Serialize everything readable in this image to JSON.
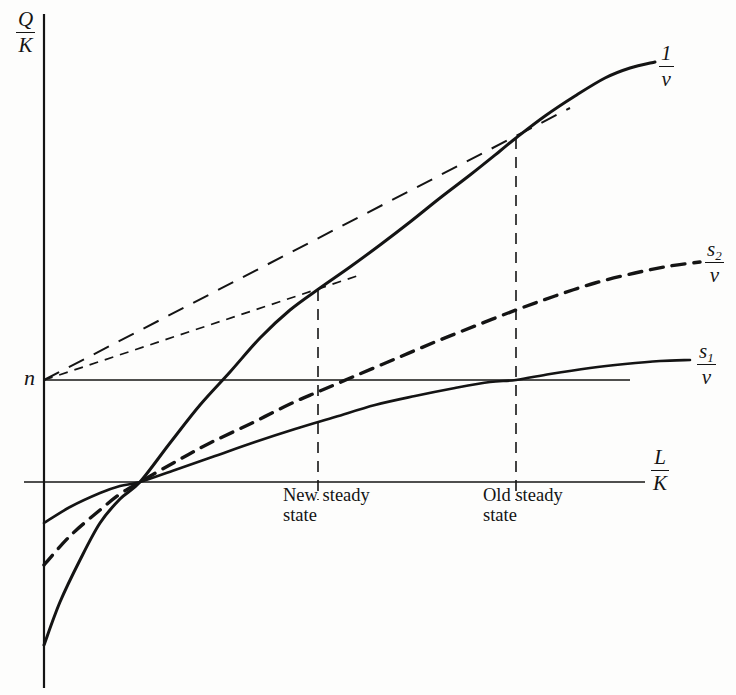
{
  "figure": {
    "background_color": "#fdfdfc",
    "ink_color": "#141414"
  },
  "axes": {
    "y_axis": {
      "label_numerator": "Q",
      "label_denominator": "K",
      "name": "output-capital-ratio"
    },
    "x_axis": {
      "label_numerator": "L",
      "label_denominator": "K",
      "name": "labor-capital-ratio"
    },
    "reference_line": {
      "label": "n",
      "description": "natural rate of growth line"
    }
  },
  "curves": [
    {
      "id": "one-over-v",
      "label_numerator": "1",
      "label_denominator": "v",
      "style": "solid",
      "width": 3.0
    },
    {
      "id": "s2-over-v",
      "label_numerator": "s",
      "label_subscript": "2",
      "label_denominator": "v",
      "style": "dashed",
      "width": 3.4
    },
    {
      "id": "s1-over-v",
      "label_numerator": "s",
      "label_subscript": "1",
      "label_denominator": "v",
      "style": "solid",
      "width": 2.6
    }
  ],
  "annotations": {
    "new_steady_state": {
      "line1": "New steady",
      "line2": "state"
    },
    "old_steady_state": {
      "line1": "Old steady",
      "line2": "state"
    }
  },
  "chart_data": {
    "type": "line",
    "title": "",
    "xlabel": "L/K",
    "ylabel": "Q/K",
    "grid": false,
    "legend": "inline-right-of-curve-ends",
    "axis_origin_px": [
      44,
      482
    ],
    "n_level_px_y": 380,
    "common_crossing_px": [
      140,
      482
    ],
    "series": [
      {
        "name": "1/v",
        "style": "solid",
        "points_px": [
          [
            44,
            645
          ],
          [
            60,
            602
          ],
          [
            80,
            560
          ],
          [
            100,
            523
          ],
          [
            120,
            499
          ],
          [
            140,
            482
          ],
          [
            170,
            443
          ],
          [
            200,
            405
          ],
          [
            230,
            372
          ],
          [
            260,
            338
          ],
          [
            290,
            310
          ],
          [
            320,
            288
          ],
          [
            350,
            267
          ],
          [
            380,
            245
          ],
          [
            410,
            222
          ],
          [
            440,
            198
          ],
          [
            470,
            175
          ],
          [
            500,
            151
          ],
          [
            516,
            138
          ],
          [
            545,
            116
          ],
          [
            575,
            96
          ],
          [
            605,
            78
          ],
          [
            630,
            68
          ],
          [
            655,
            62
          ]
        ]
      },
      {
        "name": "s2/v",
        "style": "dashed",
        "points_px": [
          [
            44,
            565
          ],
          [
            70,
            536
          ],
          [
            100,
            510
          ],
          [
            120,
            494
          ],
          [
            140,
            482
          ],
          [
            175,
            462
          ],
          [
            210,
            443
          ],
          [
            250,
            424
          ],
          [
            290,
            404
          ],
          [
            320,
            391
          ],
          [
            355,
            376
          ],
          [
            395,
            359
          ],
          [
            435,
            342
          ],
          [
            475,
            326
          ],
          [
            516,
            310
          ],
          [
            555,
            296
          ],
          [
            595,
            283
          ],
          [
            635,
            273
          ],
          [
            670,
            266
          ],
          [
            700,
            262
          ]
        ]
      },
      {
        "name": "s1/v",
        "style": "solid",
        "points_px": [
          [
            44,
            523
          ],
          [
            70,
            507
          ],
          [
            100,
            493
          ],
          [
            120,
            486
          ],
          [
            140,
            482
          ],
          [
            175,
            470
          ],
          [
            215,
            456
          ],
          [
            255,
            442
          ],
          [
            295,
            429
          ],
          [
            335,
            417
          ],
          [
            375,
            405
          ],
          [
            415,
            396
          ],
          [
            455,
            388
          ],
          [
            490,
            382
          ],
          [
            516,
            380
          ],
          [
            550,
            374
          ],
          [
            590,
            368
          ],
          [
            625,
            364
          ],
          [
            660,
            361
          ],
          [
            690,
            360
          ]
        ]
      }
    ],
    "tangent_rays": [
      {
        "name": "tangent-to-old-steady-state",
        "from_px": [
          44,
          380
        ],
        "to_px": [
          570,
          108
        ],
        "style": "long-dash",
        "touches_curve": "1/v",
        "tangency_px": [
          516,
          138
        ]
      },
      {
        "name": "tangent-to-new-steady-state",
        "from_px": [
          44,
          380
        ],
        "to_px": [
          360,
          275
        ],
        "style": "short-dash",
        "touches_curve": "1/v",
        "tangency_px": [
          318,
          290
        ]
      }
    ],
    "drop_lines": [
      {
        "name": "new-steady-state-dropline",
        "x_px": 318,
        "y_top_px": 290,
        "y_bottom_px": 500
      },
      {
        "name": "old-steady-state-dropline",
        "x_px": 516,
        "y_top_px": 138,
        "y_bottom_px": 500
      }
    ],
    "horizontal_lines": [
      {
        "name": "n-line",
        "y_px": 380,
        "x_start_px": 44,
        "x_end_px": 630
      },
      {
        "name": "x-axis",
        "y_px": 482,
        "x_start_px": 24,
        "x_end_px": 645
      }
    ]
  }
}
